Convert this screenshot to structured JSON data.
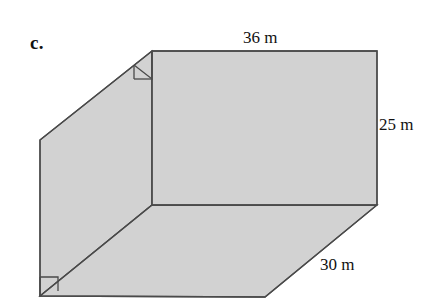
{
  "figure": {
    "item_letter": "c.",
    "shape_name": "rectangular-prism",
    "fill_color": "#d2d2d2",
    "stroke_color": "#4a4a4a",
    "background_color": "#ffffff",
    "dimensions": {
      "length_label": "36 m",
      "height_label": "25 m",
      "depth_label": "30 m"
    },
    "annotations": {
      "right_angle_top": "right-angle-marker",
      "right_angle_bottom": "right-angle-marker"
    },
    "geometry": {
      "front_top_left": [
        152,
        51
      ],
      "front_top_right": [
        377,
        51
      ],
      "front_bottom_right": [
        377,
        205
      ],
      "front_bottom_left": [
        152,
        205
      ],
      "back_top_left": [
        40,
        140
      ],
      "back_bottom_left": [
        40,
        296
      ],
      "back_bottom_right": [
        265,
        297
      ]
    }
  }
}
